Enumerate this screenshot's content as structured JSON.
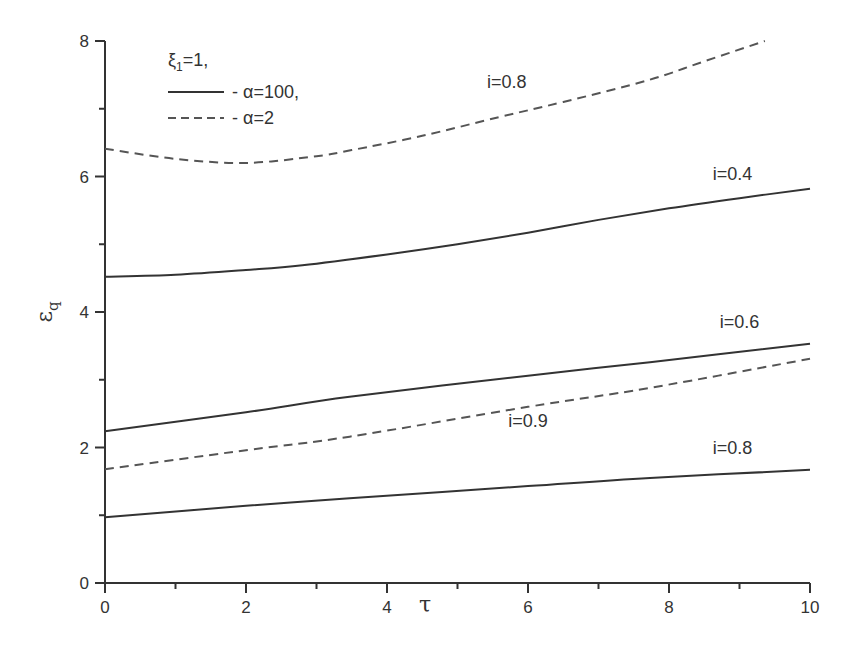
{
  "chart_data": {
    "type": "line",
    "title": "",
    "xlabel": "τ",
    "ylabel": "ε_q",
    "xlim": [
      0,
      10
    ],
    "ylim": [
      0,
      8
    ],
    "xticks": [
      0,
      2,
      4,
      6,
      8,
      10
    ],
    "yticks": [
      0,
      2,
      4,
      6,
      8
    ],
    "grid": false,
    "legend": {
      "position": "top-left",
      "header": "ξ₁=1,",
      "entries": [
        {
          "style": "solid",
          "label": "- α=100,"
        },
        {
          "style": "dashed",
          "label": "- α=2"
        }
      ]
    },
    "series": [
      {
        "name": "i=0.8, α=2",
        "style": "dashed",
        "x": [
          0,
          1,
          2,
          3,
          3.5,
          4.5,
          5.6,
          6.5,
          7.7,
          8.5,
          9.36
        ],
        "y": [
          6.41,
          6.26,
          6.2,
          6.3,
          6.39,
          6.6,
          6.88,
          7.1,
          7.42,
          7.7,
          8.0
        ]
      },
      {
        "name": "i=0.4, α=100",
        "style": "solid",
        "x": [
          0,
          1,
          2,
          2.8,
          4,
          5,
          6,
          7,
          8,
          9,
          10
        ],
        "y": [
          4.52,
          4.55,
          4.62,
          4.69,
          4.85,
          5.0,
          5.17,
          5.36,
          5.53,
          5.68,
          5.82
        ]
      },
      {
        "name": "i=0.6, α=100",
        "style": "solid",
        "x": [
          0,
          2,
          3.47,
          6,
          7.73,
          10
        ],
        "y": [
          2.24,
          2.52,
          2.75,
          3.06,
          3.26,
          3.53
        ]
      },
      {
        "name": "i=0.9, α=2",
        "style": "dashed",
        "x": [
          0,
          2,
          3.47,
          6,
          7.73,
          10
        ],
        "y": [
          1.68,
          1.96,
          2.16,
          2.6,
          2.88,
          3.31
        ]
      },
      {
        "name": "i=0.8, α=100",
        "style": "solid",
        "x": [
          0,
          2,
          3.47,
          6,
          7.73,
          10
        ],
        "y": [
          0.97,
          1.14,
          1.25,
          1.43,
          1.55,
          1.67
        ]
      }
    ],
    "annotations": [
      {
        "text": "i=0.8",
        "x": 5.7,
        "y": 7.3
      },
      {
        "text": "i=0.4",
        "x": 8.9,
        "y": 5.95
      },
      {
        "text": "i=0.6",
        "x": 9.0,
        "y": 3.76
      },
      {
        "text": "i=0.9",
        "x": 6.0,
        "y": 2.3
      },
      {
        "text": "i=0.8",
        "x": 8.9,
        "y": 1.9
      }
    ]
  },
  "style": {
    "line_color": "#333333",
    "dash_color": "#555555",
    "axis_color": "#333333"
  }
}
